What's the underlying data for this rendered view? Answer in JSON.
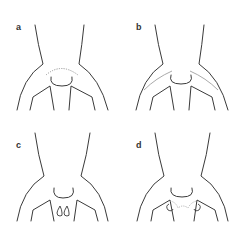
{
  "figure": {
    "panels": [
      {
        "id": "a",
        "label": "a",
        "feature": "dotted arc above suprasternal notch"
      },
      {
        "id": "b",
        "label": "b",
        "feature": "grey lines along clavicles"
      },
      {
        "id": "c",
        "label": "c",
        "feature": "two teardrop marks on chest"
      },
      {
        "id": "d",
        "label": "d",
        "feature": "dotted line between arm insertions with small loops"
      }
    ]
  },
  "colors": {
    "outline": "#3a3a3a",
    "marking": "#9a9a9a",
    "background": "#ffffff"
  }
}
